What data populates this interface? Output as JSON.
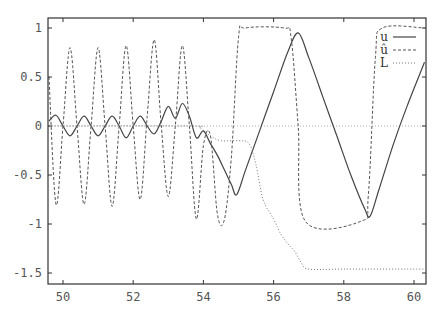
{
  "chart_data": {
    "type": "line",
    "title": "",
    "xlabel": "",
    "ylabel": "",
    "xlim": [
      49.6,
      60.3
    ],
    "ylim": [
      -1.6,
      1.1
    ],
    "grid": false,
    "legend_position": "top-right",
    "x_ticks": [
      "50",
      "52",
      "54",
      "56",
      "58",
      "60"
    ],
    "y_ticks": [
      "1",
      "0.5",
      "0",
      "-0.5",
      "-1",
      "-1.5"
    ],
    "zero_line": true,
    "series": [
      {
        "name": "u",
        "style": "solid",
        "x": [
          49.6,
          49.8,
          50.0,
          50.2,
          50.4,
          50.6,
          50.8,
          51.0,
          51.2,
          51.4,
          51.6,
          51.8,
          52.0,
          52.2,
          52.4,
          52.6,
          52.8,
          53.0,
          53.2,
          53.4,
          53.6,
          53.8,
          54.0,
          54.2,
          54.4,
          54.6,
          54.8,
          54.95,
          55.2,
          55.6,
          56.0,
          56.4,
          56.7,
          57.0,
          57.4,
          57.8,
          58.2,
          58.6,
          58.75,
          59.0,
          59.4,
          59.8,
          60.3
        ],
        "values": [
          0.05,
          0.11,
          0.0,
          -0.1,
          0.0,
          0.1,
          0.0,
          -0.1,
          0.0,
          0.1,
          0.0,
          -0.12,
          0.0,
          0.1,
          0.0,
          -0.08,
          0.05,
          0.2,
          0.08,
          0.23,
          0.1,
          -0.12,
          -0.05,
          -0.18,
          -0.3,
          -0.45,
          -0.6,
          -0.7,
          -0.45,
          -0.05,
          0.35,
          0.75,
          0.95,
          0.7,
          0.3,
          -0.1,
          -0.5,
          -0.85,
          -0.92,
          -0.65,
          -0.2,
          0.2,
          0.65
        ]
      },
      {
        "name": "û",
        "style": "dashed",
        "x": [
          49.6,
          49.8,
          50.0,
          50.2,
          50.4,
          50.6,
          50.8,
          51.0,
          51.2,
          51.4,
          51.6,
          51.8,
          52.0,
          52.2,
          52.4,
          52.6,
          52.8,
          53.0,
          53.2,
          53.4,
          53.6,
          53.8,
          54.0,
          54.2,
          54.4,
          54.6,
          54.8,
          55.0,
          55.2,
          56.3,
          56.5,
          56.7,
          56.9,
          58.5,
          58.7,
          58.9,
          59.1,
          60.3
        ],
        "values": [
          0.5,
          -0.8,
          0.0,
          0.8,
          0.0,
          -0.8,
          0.0,
          0.8,
          0.0,
          -0.82,
          0.0,
          0.82,
          0.0,
          -0.75,
          0.1,
          0.88,
          0.0,
          -0.72,
          0.0,
          0.82,
          0.0,
          -0.95,
          -0.2,
          -0.1,
          -0.9,
          -0.95,
          -0.3,
          0.9,
          1.0,
          1.0,
          0.9,
          0.0,
          -0.97,
          -0.97,
          -0.7,
          0.7,
          1.0,
          1.0
        ]
      },
      {
        "name": "L",
        "style": "dotted",
        "x": [
          49.6,
          53.6,
          53.9,
          54.2,
          54.5,
          55.0,
          55.3,
          55.5,
          55.7,
          56.0,
          56.2,
          56.4,
          56.6,
          56.8,
          57.0,
          58.0,
          60.3
        ],
        "values": [
          0.0,
          0.0,
          -0.02,
          -0.1,
          -0.15,
          -0.15,
          -0.18,
          -0.4,
          -0.75,
          -0.95,
          -1.1,
          -1.2,
          -1.28,
          -1.4,
          -1.46,
          -1.46,
          -1.46
        ]
      }
    ]
  },
  "legend": {
    "items": [
      {
        "label": "u",
        "style": "solid"
      },
      {
        "label": "û",
        "style": "dashed"
      },
      {
        "label": "L",
        "style": "dotted"
      }
    ]
  }
}
